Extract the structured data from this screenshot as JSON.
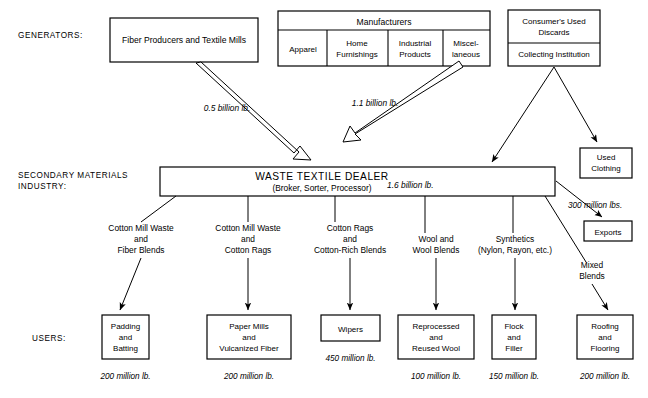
{
  "diagram": {
    "row_labels": {
      "generators": "GENERATORS:",
      "secondary_line1": "SECONDARY MATERIALS",
      "secondary_line2": "INDUSTRY:",
      "users": "USERS:"
    },
    "generators": {
      "fiber_producers": "Fiber Producers and Textile Mills",
      "manufacturers": {
        "header": "Manufacturers",
        "segments": [
          {
            "line1": "Apparel",
            "line2": ""
          },
          {
            "line1": "Home",
            "line2": "Furnishings"
          },
          {
            "line1": "Industrial",
            "line2": "Products"
          },
          {
            "line1": "Miscel-",
            "line2": "laneous"
          }
        ]
      },
      "consumers": {
        "header_line1": "Consumer's Used",
        "header_line2": "Discards",
        "sub": "Collecting Institution"
      }
    },
    "dealer": {
      "title": "WASTE TEXTILE DEALER",
      "subtitle": "(Broker, Sorter, Processor)",
      "throughput": "1.6 billion lb."
    },
    "input_flows": [
      {
        "amount": "0.5 billion lb.",
        "from": "fiber-producers"
      },
      {
        "amount": "1.1 billion lb.",
        "from": "manufacturers"
      }
    ],
    "side_outputs": [
      {
        "label_line1": "Used",
        "label_line2": "Clothing",
        "amount": ""
      },
      {
        "label_line1": "Exports",
        "label_line2": "",
        "amount": "300 million lbs."
      }
    ],
    "material_streams": [
      {
        "line1": "Cotton Mill Waste",
        "line2": "and",
        "line3": "Fiber Blends"
      },
      {
        "line1": "Cotton Mill Waste",
        "line2": "and",
        "line3": "Cotton Rags"
      },
      {
        "line1": "Cotton Rags",
        "line2": "and",
        "line3": "Cotton-Rich Blends"
      },
      {
        "line1": "Wool and",
        "line2": "Wool Blends",
        "line3": ""
      },
      {
        "line1": "Synthetics",
        "line2": "(Nylon, Rayon, etc.)",
        "line3": ""
      },
      {
        "line1": "Mixed",
        "line2": "Blends",
        "line3": ""
      }
    ],
    "users": [
      {
        "line1": "Padding",
        "line2": "and",
        "line3": "Batting",
        "amount": "200 million lb."
      },
      {
        "line1": "Paper Mills",
        "line2": "and",
        "line3": "Vulcanized Fiber",
        "amount": "200 million lb."
      },
      {
        "line1": "Wipers",
        "line2": "",
        "line3": "",
        "amount": "450 million lb."
      },
      {
        "line1": "Reprocessed",
        "line2": "and",
        "line3": "Reused Wool",
        "amount": "100 million lb."
      },
      {
        "line1": "Flock",
        "line2": "and",
        "line3": "Filler",
        "amount": "150 million lb."
      },
      {
        "line1": "Roofing",
        "line2": "and",
        "line3": "Flooring",
        "amount": "200 million lb."
      }
    ],
    "colors": {
      "stroke": "#000000",
      "fill": "#ffffff",
      "text": "#000000"
    }
  }
}
